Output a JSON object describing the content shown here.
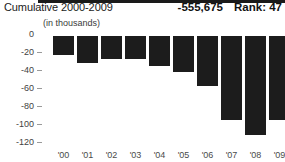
{
  "header": {
    "title": "Cumulative 2000-2009",
    "value": "-555,675",
    "rank": "Rank: 47"
  },
  "subtitle": "(in thousands)",
  "chart_data": {
    "type": "bar",
    "title": "Cumulative 2000-2009",
    "subtitle": "(in thousands)",
    "xlabel": "",
    "ylabel": "",
    "categories": [
      "'00",
      "'01",
      "'02",
      "'03",
      "'04",
      "'05",
      "'06",
      "'07",
      "'08",
      "'09"
    ],
    "values": [
      -21,
      -30,
      -26,
      -26,
      -33,
      -40,
      -55,
      -93,
      -110,
      -93
    ],
    "ylim": [
      -120,
      0
    ],
    "ytick_labels": [
      "0",
      "-20",
      "-40",
      "-60",
      "-80",
      "-100",
      "-120"
    ],
    "ytick_values": [
      0,
      -20,
      -40,
      -60,
      -80,
      -100,
      -120
    ],
    "grid": false,
    "legend": false,
    "bar_color": "#1c1c1c",
    "zero_line_color": "#1a1a1a",
    "cumulative_total": "-555,675",
    "rank": "Rank: 47"
  }
}
